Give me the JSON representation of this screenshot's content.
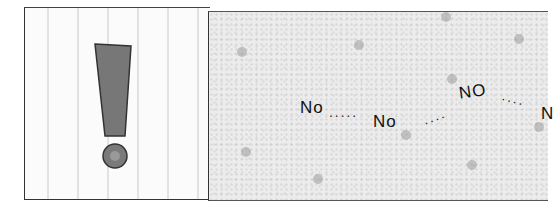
{
  "comic": {
    "panels": [
      {
        "id": "left",
        "content": "exclamation-mark"
      },
      {
        "id": "right",
        "speech": [
          "No",
          "No",
          "No",
          "N"
        ]
      }
    ],
    "utterances": {
      "first": "No",
      "second": "No",
      "third": "NO",
      "fourth_partial": "N"
    },
    "ellipses": {
      "a": ".....",
      "b": "....",
      "c": "...."
    },
    "colors": {
      "ink": "#222222",
      "exclamation_fill": "#777777",
      "right_panel_bg": "#ececec",
      "left_panel_bg": "#fbfbfb"
    }
  }
}
